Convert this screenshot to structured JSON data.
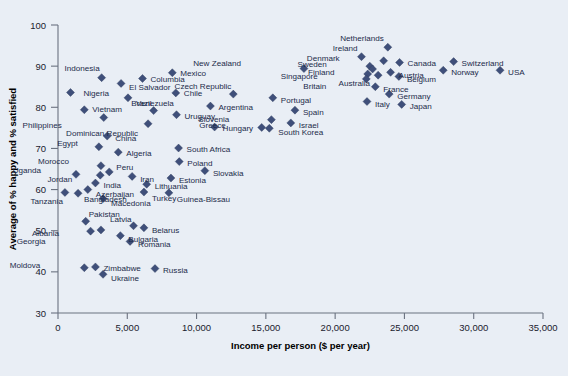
{
  "chart_data": {
    "type": "scatter",
    "title": "",
    "xlabel": "Income per person ($ per year)",
    "ylabel": "Average of % happy and % satisfied",
    "xlim": [
      0,
      35000
    ],
    "ylim": [
      30,
      100
    ],
    "xticks": [
      0,
      5000,
      10000,
      15000,
      20000,
      25000,
      30000,
      35000
    ],
    "xticklabels": [
      "0",
      "5,000",
      "10,000",
      "15,000",
      "20,000",
      "25,000",
      "30,000",
      "35,000"
    ],
    "yticks": [
      30,
      40,
      50,
      60,
      70,
      80,
      90,
      100
    ],
    "yticklabels": [
      "30",
      "40",
      "50",
      "60",
      "70",
      "80",
      "90",
      "100"
    ],
    "grid": false,
    "legend": "none",
    "marker": "diamond",
    "marker_color": "#3f4f7a",
    "background_color": "#e9eef5",
    "points": [
      {
        "label": "Nigeria",
        "x": 900,
        "y": 83.6,
        "lx": 13,
        "ly": 1
      },
      {
        "label": "Indonesia",
        "x": 3150,
        "y": 87.2,
        "lx": -2,
        "ly": -10
      },
      {
        "label": "El Salvador",
        "x": 4550,
        "y": 85.8,
        "lx": 8,
        "ly": 4
      },
      {
        "label": "Columbia",
        "x": 6100,
        "y": 87.0,
        "lx": 8,
        "ly": 1
      },
      {
        "label": "Mexico",
        "x": 8250,
        "y": 88.4,
        "lx": 8,
        "ly": 0
      },
      {
        "label": "Venezuela",
        "x": 5050,
        "y": 82.3,
        "lx": 8,
        "ly": 5
      },
      {
        "label": "Chile",
        "x": 8500,
        "y": 83.5,
        "lx": 8,
        "ly": 0
      },
      {
        "label": "Vietnam",
        "x": 1900,
        "y": 79.4,
        "lx": 8,
        "ly": -1
      },
      {
        "label": "Brazil",
        "x": 6900,
        "y": 79.2,
        "lx": -2,
        "ly": -8
      },
      {
        "label": "Uruguay",
        "x": 8550,
        "y": 78.2,
        "lx": 8,
        "ly": 1
      },
      {
        "label": "Philippines",
        "x": 3300,
        "y": 77.5,
        "lx": -42,
        "ly": 7
      },
      {
        "label": "Dominican Republic",
        "x": 6500,
        "y": 76.0,
        "lx": -10,
        "ly": 9
      },
      {
        "label": "Hungary",
        "x": 11300,
        "y": 75.2,
        "lx": 8,
        "ly": 1
      },
      {
        "label": "China",
        "x": 3550,
        "y": 73.0,
        "lx": 8,
        "ly": 2
      },
      {
        "label": "Egypt",
        "x": 2950,
        "y": 70.4,
        "lx": -21,
        "ly": -4
      },
      {
        "label": "Algeria",
        "x": 4350,
        "y": 69.1,
        "lx": 8,
        "ly": 1
      },
      {
        "label": "South Africa",
        "x": 8700,
        "y": 70.1,
        "lx": 8,
        "ly": 1
      },
      {
        "label": "Morocco",
        "x": 3100,
        "y": 65.8,
        "lx": -32,
        "ly": -5
      },
      {
        "label": "Uganda",
        "x": 1300,
        "y": 63.7,
        "lx": -35,
        "ly": -4
      },
      {
        "label": "Jordan",
        "x": 3050,
        "y": 63.5,
        "lx": -28,
        "ly": 4
      },
      {
        "label": "Peru",
        "x": 3700,
        "y": 64.3,
        "lx": 7,
        "ly": -5
      },
      {
        "label": "Iran",
        "x": 5350,
        "y": 63.2,
        "lx": 8,
        "ly": 3
      },
      {
        "label": "Poland",
        "x": 8750,
        "y": 66.8,
        "lx": 8,
        "ly": 1
      },
      {
        "label": "Slovakia",
        "x": 10600,
        "y": 64.6,
        "lx": 8,
        "ly": 2
      },
      {
        "label": "Estonia",
        "x": 8150,
        "y": 62.8,
        "lx": 8,
        "ly": 2
      },
      {
        "label": "India",
        "x": 2700,
        "y": 61.6,
        "lx": 8,
        "ly": 2
      },
      {
        "label": "Lithuania",
        "x": 6400,
        "y": 61.3,
        "lx": 8,
        "ly": 2
      },
      {
        "label": "Azerbaijan",
        "x": 2150,
        "y": 60.0,
        "lx": 8,
        "ly": 4
      },
      {
        "label": "Turkey",
        "x": 6200,
        "y": 59.4,
        "lx": 8,
        "ly": 6
      },
      {
        "label": "Guinea-Bissau",
        "x": 8000,
        "y": 59.2,
        "lx": 8,
        "ly": 6
      },
      {
        "label": "Bangladesh",
        "x": 1450,
        "y": 59.1,
        "lx": 6,
        "ly": 6
      },
      {
        "label": "Tanzania",
        "x": 500,
        "y": 59.3,
        "lx": -2,
        "ly": 9
      },
      {
        "label": "Macedonia",
        "x": 3250,
        "y": 57.8,
        "lx": 8,
        "ly": 4
      },
      {
        "label": "Pakistan",
        "x": 2000,
        "y": 52.3,
        "lx": 3,
        "ly": -7
      },
      {
        "label": "Latvia",
        "x": 5450,
        "y": 51.2,
        "lx": -2,
        "ly": -7
      },
      {
        "label": "Belarus",
        "x": 6200,
        "y": 50.7,
        "lx": 8,
        "ly": 2
      },
      {
        "label": "Albania",
        "x": 3100,
        "y": 50.2,
        "lx": -42,
        "ly": 3
      },
      {
        "label": "Georgia",
        "x": 2350,
        "y": 49.9,
        "lx": -45,
        "ly": 10
      },
      {
        "label": "Bulgaria",
        "x": 4500,
        "y": 48.8,
        "lx": 8,
        "ly": 3
      },
      {
        "label": "Romania",
        "x": 5200,
        "y": 47.4,
        "lx": 8,
        "ly": 3
      },
      {
        "label": "Moldova",
        "x": 1900,
        "y": 41.0,
        "lx": -44,
        "ly": -3
      },
      {
        "label": "Zimbabwe",
        "x": 2700,
        "y": 41.2,
        "lx": 8,
        "ly": 1
      },
      {
        "label": "Ukraine",
        "x": 3250,
        "y": 39.4,
        "lx": 8,
        "ly": 4
      },
      {
        "label": "Russia",
        "x": 7000,
        "y": 40.8,
        "lx": 8,
        "ly": 1
      },
      {
        "label": "New Zealand",
        "x": 17750,
        "y": 89.4,
        "lx": -63,
        "ly": -6
      },
      {
        "label": "Czech Republic",
        "x": 12650,
        "y": 83.2,
        "lx": -2,
        "ly": -8
      },
      {
        "label": "Argentina",
        "x": 11000,
        "y": 80.3,
        "lx": 8,
        "ly": 1
      },
      {
        "label": "Portugal",
        "x": 15500,
        "y": 82.3,
        "lx": 8,
        "ly": 2
      },
      {
        "label": "Spain",
        "x": 17100,
        "y": 79.3,
        "lx": 8,
        "ly": 2
      },
      {
        "label": "Slovenia",
        "x": 15400,
        "y": 77.0,
        "lx": -42,
        "ly": -1
      },
      {
        "label": "Greece",
        "x": 14700,
        "y": 75.1,
        "lx": -36,
        "ly": -2
      },
      {
        "label": "South Korea",
        "x": 15250,
        "y": 74.9,
        "lx": 9,
        "ly": 4
      },
      {
        "label": "Israel",
        "x": 16800,
        "y": 76.2,
        "lx": 8,
        "ly": 2
      },
      {
        "label": "Ireland",
        "x": 21900,
        "y": 92.3,
        "lx": -4,
        "ly": -9
      },
      {
        "label": "Netherlands",
        "x": 23800,
        "y": 94.6,
        "lx": -4,
        "ly": -9
      },
      {
        "label": "Denmark",
        "x": 23500,
        "y": 91.3,
        "lx": -44,
        "ly": -3
      },
      {
        "label": "Canada",
        "x": 24650,
        "y": 90.9,
        "lx": 8,
        "ly": 1
      },
      {
        "label": "Switzerland",
        "x": 28550,
        "y": 91.1,
        "lx": 8,
        "ly": 1
      },
      {
        "label": "Sweden",
        "x": 22500,
        "y": 90.0,
        "lx": -43,
        "ly": -2
      },
      {
        "label": "Finland",
        "x": 22700,
        "y": 89.3,
        "lx": -38,
        "ly": 3
      },
      {
        "label": "Austria",
        "x": 24000,
        "y": 88.5,
        "lx": 8,
        "ly": 3
      },
      {
        "label": "Norway",
        "x": 27800,
        "y": 89.0,
        "lx": 8,
        "ly": 2
      },
      {
        "label": "USA",
        "x": 31900,
        "y": 89.0,
        "lx": 8,
        "ly": 2
      },
      {
        "label": "Singapore",
        "x": 22350,
        "y": 88.1,
        "lx": -50,
        "ly": 2
      },
      {
        "label": "Australia",
        "x": 23100,
        "y": 87.8,
        "lx": -8,
        "ly": 8
      },
      {
        "label": "Belgium",
        "x": 24600,
        "y": 87.5,
        "lx": 8,
        "ly": 3
      },
      {
        "label": "Britain",
        "x": 22250,
        "y": 86.9,
        "lx": -40,
        "ly": 7
      },
      {
        "label": "France",
        "x": 22900,
        "y": 85.0,
        "lx": 8,
        "ly": 2
      },
      {
        "label": "Germany",
        "x": 23900,
        "y": 83.2,
        "lx": 8,
        "ly": 2
      },
      {
        "label": "Italy",
        "x": 22300,
        "y": 81.4,
        "lx": 8,
        "ly": 2
      },
      {
        "label": "Japan",
        "x": 24800,
        "y": 80.7,
        "lx": 8,
        "ly": 2
      }
    ]
  }
}
